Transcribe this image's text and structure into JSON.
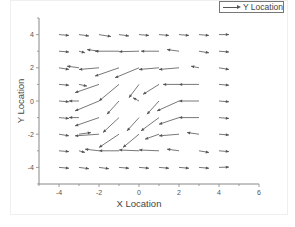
{
  "legend": {
    "label": "Y Location"
  },
  "axes": {
    "xlabel": "X Location",
    "ylabel": "Y Location",
    "xticks": [
      "-4",
      "-2",
      "0",
      "2",
      "4",
      "6"
    ],
    "yticks": [
      "4",
      "2",
      "0",
      "-2",
      "-4"
    ]
  },
  "colors": {
    "arrow": "#555555",
    "axis": "#888888",
    "text": "#444444"
  },
  "chart_data": {
    "type": "vector_field",
    "title": "",
    "xlabel": "X Location",
    "ylabel": "Y Location",
    "xlim": [
      -5,
      6
    ],
    "ylim": [
      -5,
      5
    ],
    "xticks": [
      -4,
      -2,
      0,
      2,
      4,
      6
    ],
    "yticks": [
      -4,
      -2,
      0,
      2,
      4
    ],
    "grid": false,
    "legend": {
      "entries": [
        "Y Location"
      ],
      "position": "top-right"
    },
    "note": "Each vector is [x, y, dx, dy]; arrow drawn from (x,y) to (x+dx, y+dy).",
    "vectors": [
      [
        -4,
        4,
        0.5,
        -0.05
      ],
      [
        -3,
        4,
        0.5,
        -0.08
      ],
      [
        -2,
        4,
        0.6,
        -0.12
      ],
      [
        -1,
        4,
        0.5,
        -0.08
      ],
      [
        0,
        4,
        0.5,
        -0.05
      ],
      [
        1,
        4,
        0.5,
        -0.05
      ],
      [
        2,
        4,
        0.5,
        -0.05
      ],
      [
        3,
        4,
        0.5,
        -0.05
      ],
      [
        4,
        4,
        0.5,
        0.0
      ],
      [
        -4,
        3,
        0.5,
        -0.05
      ],
      [
        -3,
        3,
        0.3,
        -0.1
      ],
      [
        -2,
        3,
        -0.6,
        0.1
      ],
      [
        -1,
        3,
        -1.2,
        0.0
      ],
      [
        0,
        3,
        -1.0,
        -0.03
      ],
      [
        1,
        3,
        -0.9,
        0.0
      ],
      [
        2,
        3,
        -0.6,
        0.1
      ],
      [
        3,
        3,
        0.5,
        -0.1
      ],
      [
        4,
        3,
        0.5,
        -0.05
      ],
      [
        -4,
        2,
        0.5,
        -0.1
      ],
      [
        -3,
        2,
        -0.6,
        0.1
      ],
      [
        -2,
        2,
        -1.0,
        -0.1
      ],
      [
        -1,
        2,
        -1.2,
        -0.5
      ],
      [
        0,
        2,
        -1.2,
        -0.6
      ],
      [
        1,
        2,
        -1.0,
        -0.1
      ],
      [
        2,
        2,
        -1.0,
        -0.1
      ],
      [
        3,
        2,
        -0.4,
        0.1
      ],
      [
        4,
        2,
        0.5,
        -0.1
      ],
      [
        -4,
        1,
        0.5,
        -0.05
      ],
      [
        -3,
        1,
        0.4,
        -0.1
      ],
      [
        -2,
        1,
        -1.2,
        -0.5
      ],
      [
        -1,
        1,
        -1.0,
        -1.0
      ],
      [
        0,
        1,
        -0.5,
        -0.8
      ],
      [
        1,
        1,
        -0.8,
        -0.6
      ],
      [
        2,
        1,
        -0.8,
        0.0
      ],
      [
        3,
        1,
        -1.0,
        0.0
      ],
      [
        4,
        1,
        0.5,
        -0.05
      ],
      [
        -4,
        0,
        0.5,
        -0.05
      ],
      [
        -3,
        0,
        -0.5,
        0.0
      ],
      [
        -2,
        0,
        -1.2,
        -0.6
      ],
      [
        -1,
        0,
        -0.6,
        -0.8
      ],
      [
        0,
        0,
        -0.3,
        0.2
      ],
      [
        1,
        0,
        -0.6,
        -0.8
      ],
      [
        2,
        0,
        -1.1,
        -0.6
      ],
      [
        3,
        0,
        -1.0,
        0.0
      ],
      [
        4,
        0,
        0.5,
        -0.05
      ],
      [
        -4,
        -1,
        0.5,
        -0.05
      ],
      [
        -3,
        -1,
        -0.5,
        0.0
      ],
      [
        -2,
        -1,
        -1.2,
        -0.5
      ],
      [
        -1,
        -1,
        -0.8,
        -0.9
      ],
      [
        0,
        -1,
        -0.6,
        -0.8
      ],
      [
        1,
        -1,
        -0.9,
        -0.8
      ],
      [
        2,
        -1,
        -1.0,
        -0.4
      ],
      [
        3,
        -1,
        -1.0,
        0.0
      ],
      [
        4,
        -1,
        0.5,
        -0.05
      ],
      [
        -4,
        -2,
        0.5,
        -0.1
      ],
      [
        -3,
        -2,
        0.6,
        0.1
      ],
      [
        -2,
        -2,
        -1.2,
        -0.1
      ],
      [
        -1,
        -2,
        -1.0,
        -0.8
      ],
      [
        0,
        -2,
        -0.8,
        -0.8
      ],
      [
        1,
        -2,
        -0.7,
        -0.3
      ],
      [
        2,
        -2,
        -1.0,
        -0.1
      ],
      [
        3,
        -2,
        -0.6,
        0.1
      ],
      [
        4,
        -2,
        0.5,
        -0.05
      ],
      [
        -4,
        -3,
        0.5,
        -0.05
      ],
      [
        -3,
        -3,
        0.3,
        -0.1
      ],
      [
        -2,
        -3,
        -0.7,
        0.1
      ],
      [
        -1,
        -3,
        -1.0,
        0.0
      ],
      [
        0,
        -3,
        -1.0,
        0.05
      ],
      [
        1,
        -3,
        -1.0,
        0.05
      ],
      [
        2,
        -3,
        -0.6,
        0.1
      ],
      [
        3,
        -3,
        0.5,
        -0.1
      ],
      [
        4,
        -3,
        0.5,
        -0.05
      ],
      [
        -4,
        -4,
        0.5,
        -0.05
      ],
      [
        -3,
        -4,
        0.5,
        -0.08
      ],
      [
        -2,
        -4,
        0.5,
        -0.08
      ],
      [
        -1,
        -4,
        0.5,
        -0.05
      ],
      [
        0,
        -4,
        0.5,
        -0.05
      ],
      [
        1,
        -4,
        0.5,
        -0.05
      ],
      [
        2,
        -4,
        0.5,
        -0.05
      ],
      [
        3,
        -4,
        0.5,
        -0.05
      ],
      [
        4,
        -4,
        0.5,
        0.02
      ]
    ]
  }
}
